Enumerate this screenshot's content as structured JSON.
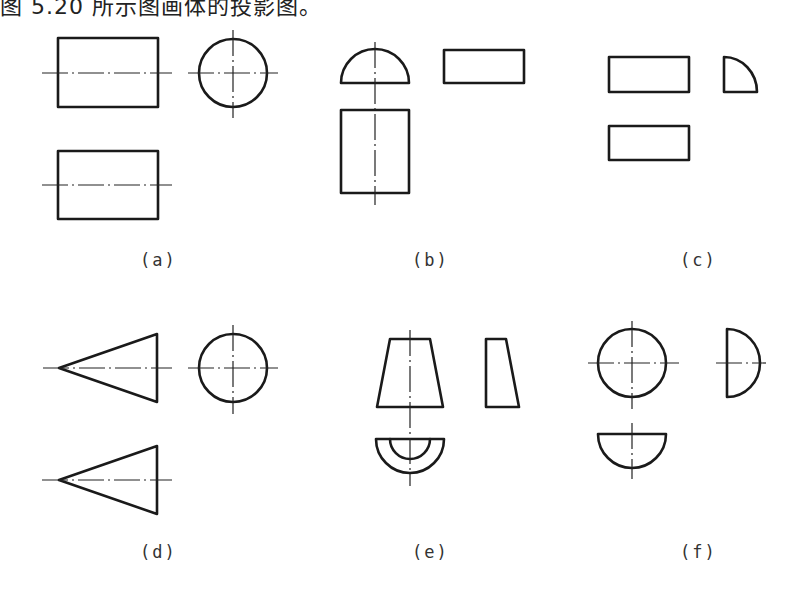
{
  "caption": "图 5.20 所示图画体的投影图。",
  "figure": {
    "panels": [
      {
        "id": "a",
        "label": "(a)",
        "views": [
          "rectangle front view with horizontal centerline",
          "circle side view with crosshair",
          "rectangle top view with horizontal centerline"
        ]
      },
      {
        "id": "b",
        "label": "(b)",
        "views": [
          "semicircle view",
          "rectangle side view",
          "rectangle view with vertical centerline"
        ]
      },
      {
        "id": "c",
        "label": "(c)",
        "views": [
          "rectangle front view",
          "quarter-circle side view",
          "rectangle top view"
        ]
      },
      {
        "id": "d",
        "label": "(d)",
        "views": [
          "triangle (cone) front view with centerline",
          "circle side view with crosshair",
          "triangle (cone) top view with centerline"
        ]
      },
      {
        "id": "e",
        "label": "(e)",
        "views": [
          "trapezoid front view with vertical centerline",
          "right-trapezoid side view",
          "half-ring top view"
        ]
      },
      {
        "id": "f",
        "label": "(f)",
        "views": [
          "circle front view with crosshair",
          "half-circle side view",
          "semicircle top view"
        ]
      }
    ]
  }
}
